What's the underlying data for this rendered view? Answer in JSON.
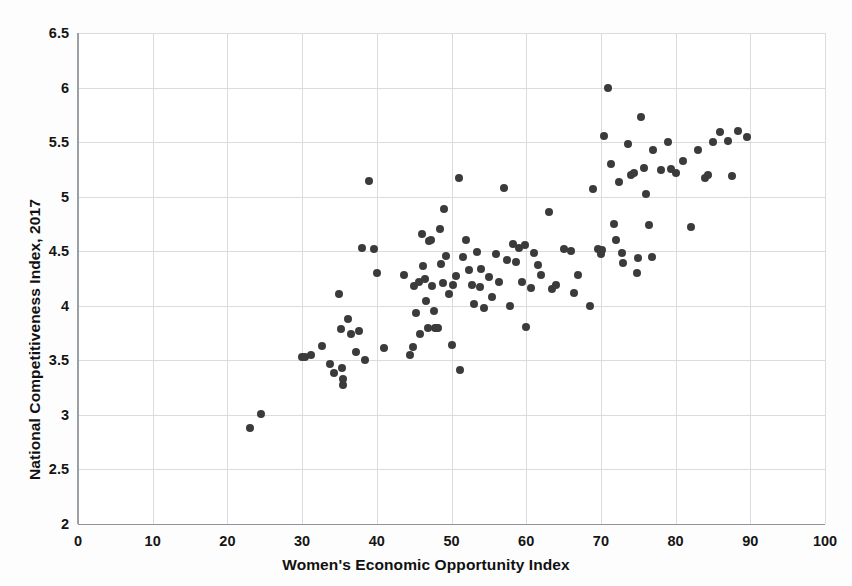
{
  "chart_title_fragment": "WOMEN'S ECONOMIC OPPORTUNITY AND COMPETITIVENESS",
  "axis": {
    "x_label": "Women's Economic Opportunity Index",
    "y_label": "National Competitiveness Index, 2017"
  },
  "chart_data": {
    "type": "scatter",
    "title": "WOMEN'S ECONOMIC OPPORTUNITY AND COMPETITIVENESS",
    "xlabel": "Women's Economic Opportunity Index",
    "ylabel": "National Competitiveness Index, 2017",
    "xlim": [
      0,
      100
    ],
    "ylim": [
      2,
      6.5
    ],
    "xticks": [
      0,
      10,
      20,
      30,
      40,
      50,
      60,
      70,
      80,
      90,
      100
    ],
    "yticks": [
      2,
      2.5,
      3,
      3.5,
      4,
      4.5,
      5,
      5.5,
      6,
      6.5
    ],
    "xtick_labels": [
      "0",
      "10",
      "20",
      "30",
      "40",
      "50",
      "60",
      "70",
      "80",
      "90",
      "100"
    ],
    "ytick_labels": [
      "2",
      "2.5",
      "3",
      "3.5",
      "4",
      "4.5",
      "5",
      "5.5",
      "6",
      "6.5"
    ],
    "grid": true,
    "legend": null,
    "marker_color": "#3b3b3b",
    "marker_size_px": 8,
    "series": [
      {
        "name": "Countries",
        "points": [
          [
            23.0,
            2.88
          ],
          [
            24.5,
            3.01
          ],
          [
            30.0,
            3.53
          ],
          [
            30.4,
            3.53
          ],
          [
            31.2,
            3.55
          ],
          [
            32.6,
            3.63
          ],
          [
            33.8,
            3.47
          ],
          [
            34.3,
            3.38
          ],
          [
            35.0,
            4.11
          ],
          [
            35.2,
            3.79
          ],
          [
            35.4,
            3.43
          ],
          [
            35.5,
            3.27
          ],
          [
            35.5,
            3.33
          ],
          [
            36.2,
            3.88
          ],
          [
            36.6,
            3.74
          ],
          [
            37.2,
            3.58
          ],
          [
            37.6,
            3.77
          ],
          [
            38.0,
            4.53
          ],
          [
            38.4,
            3.5
          ],
          [
            39.0,
            5.14
          ],
          [
            39.6,
            4.52
          ],
          [
            40.0,
            4.3
          ],
          [
            41.0,
            3.61
          ],
          [
            43.6,
            4.28
          ],
          [
            44.4,
            3.55
          ],
          [
            44.8,
            3.62
          ],
          [
            45.0,
            4.18
          ],
          [
            45.2,
            3.93
          ],
          [
            45.6,
            4.22
          ],
          [
            45.8,
            3.74
          ],
          [
            46.0,
            4.66
          ],
          [
            46.2,
            4.36
          ],
          [
            46.4,
            4.25
          ],
          [
            46.6,
            4.04
          ],
          [
            46.8,
            3.8
          ],
          [
            47.0,
            4.59
          ],
          [
            47.2,
            4.6
          ],
          [
            47.4,
            4.18
          ],
          [
            47.6,
            3.95
          ],
          [
            47.8,
            3.8
          ],
          [
            48.0,
            3.8
          ],
          [
            48.2,
            3.8
          ],
          [
            48.4,
            4.7
          ],
          [
            48.6,
            4.38
          ],
          [
            48.8,
            4.21
          ],
          [
            49.0,
            4.89
          ],
          [
            49.2,
            4.46
          ],
          [
            49.6,
            4.11
          ],
          [
            50.0,
            3.64
          ],
          [
            50.2,
            4.19
          ],
          [
            50.6,
            4.27
          ],
          [
            51.0,
            5.17
          ],
          [
            51.2,
            3.41
          ],
          [
            51.6,
            4.45
          ],
          [
            52.0,
            4.6
          ],
          [
            52.4,
            4.33
          ],
          [
            52.8,
            4.19
          ],
          [
            53.0,
            4.02
          ],
          [
            53.4,
            4.49
          ],
          [
            53.8,
            4.17
          ],
          [
            54.0,
            4.34
          ],
          [
            54.4,
            3.98
          ],
          [
            55.0,
            4.26
          ],
          [
            55.4,
            4.08
          ],
          [
            56.0,
            4.47
          ],
          [
            56.4,
            4.22
          ],
          [
            57.0,
            5.08
          ],
          [
            57.4,
            4.42
          ],
          [
            57.8,
            4.0
          ],
          [
            58.2,
            4.57
          ],
          [
            58.6,
            4.4
          ],
          [
            59.0,
            4.53
          ],
          [
            59.4,
            4.22
          ],
          [
            59.8,
            4.56
          ],
          [
            60.0,
            3.81
          ],
          [
            60.6,
            4.16
          ],
          [
            61.0,
            4.48
          ],
          [
            61.6,
            4.37
          ],
          [
            62.0,
            4.28
          ],
          [
            63.0,
            4.86
          ],
          [
            63.4,
            4.15
          ],
          [
            64.0,
            4.19
          ],
          [
            65.0,
            4.52
          ],
          [
            66.0,
            4.5
          ],
          [
            66.4,
            4.12
          ],
          [
            67.0,
            4.28
          ],
          [
            68.5,
            4.0
          ],
          [
            69.0,
            5.07
          ],
          [
            69.6,
            4.52
          ],
          [
            70.0,
            4.47
          ],
          [
            70.2,
            4.51
          ],
          [
            70.4,
            5.56
          ],
          [
            71.0,
            6.0
          ],
          [
            71.4,
            5.3
          ],
          [
            71.8,
            4.75
          ],
          [
            72.0,
            4.6
          ],
          [
            72.4,
            5.13
          ],
          [
            72.8,
            4.48
          ],
          [
            73.0,
            4.39
          ],
          [
            73.6,
            5.48
          ],
          [
            74.0,
            5.2
          ],
          [
            74.4,
            5.22
          ],
          [
            74.8,
            4.3
          ],
          [
            75.0,
            4.44
          ],
          [
            75.4,
            5.73
          ],
          [
            75.8,
            5.26
          ],
          [
            76.0,
            5.02
          ],
          [
            76.4,
            4.74
          ],
          [
            76.8,
            4.45
          ],
          [
            77.0,
            5.43
          ],
          [
            78.0,
            5.24
          ],
          [
            79.0,
            5.5
          ],
          [
            79.4,
            5.25
          ],
          [
            80.0,
            5.22
          ],
          [
            81.0,
            5.33
          ],
          [
            82.0,
            4.72
          ],
          [
            83.0,
            5.43
          ],
          [
            84.0,
            5.17
          ],
          [
            84.4,
            5.2
          ],
          [
            85.0,
            5.5
          ],
          [
            86.0,
            5.59
          ],
          [
            87.0,
            5.51
          ],
          [
            87.6,
            5.19
          ],
          [
            88.4,
            5.6
          ],
          [
            89.6,
            5.55
          ]
        ]
      }
    ]
  }
}
